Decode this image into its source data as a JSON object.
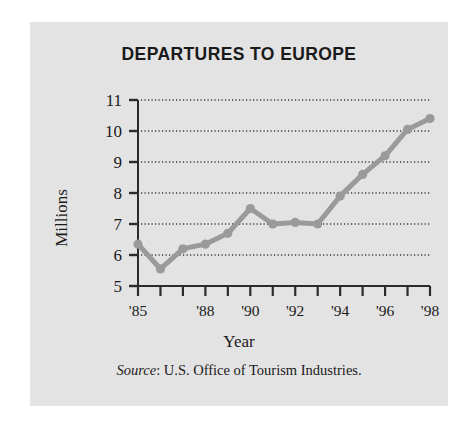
{
  "figure": {
    "title": "DEPARTURES TO EUROPE",
    "source_prefix": "Source",
    "source_text": ": U.S. Office of Tourism Industries.",
    "panel_color": "#e3e3e3",
    "series_color": "#9a9a9a",
    "axis_color": "#2b2b2b"
  },
  "chart_data": {
    "type": "line",
    "title": "DEPARTURES TO EUROPE",
    "xlabel": "Year",
    "ylabel": "Millions",
    "ylim": [
      5,
      11
    ],
    "xlim": [
      1985,
      1998
    ],
    "grid": true,
    "legend": "none",
    "ytick_labels": [
      "11",
      "10",
      "9",
      "8",
      "7",
      "6",
      "5"
    ],
    "ytick_values": [
      11,
      10,
      9,
      8,
      7,
      6,
      5
    ],
    "xtick_values": [
      1985,
      1986,
      1987,
      1988,
      1989,
      1990,
      1991,
      1992,
      1993,
      1994,
      1995,
      1996,
      1997,
      1998
    ],
    "xtick_labels": [
      "'85",
      "",
      "",
      "'88",
      "",
      "'90",
      "",
      "'92",
      "",
      "'94",
      "",
      "'96",
      "",
      "'98"
    ],
    "x": [
      1985,
      1986,
      1987,
      1988,
      1989,
      1990,
      1991,
      1992,
      1993,
      1994,
      1995,
      1996,
      1997,
      1998
    ],
    "values": [
      6.35,
      5.55,
      6.2,
      6.35,
      6.7,
      7.5,
      7.0,
      7.05,
      7.0,
      7.9,
      8.6,
      9.2,
      10.05,
      10.4
    ],
    "marker": "circle",
    "source": "Source: U.S. Office of Tourism Industries."
  }
}
